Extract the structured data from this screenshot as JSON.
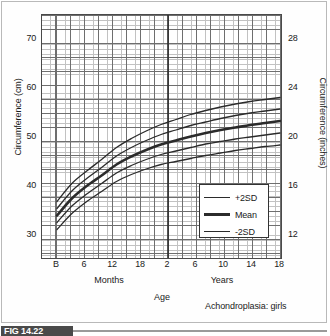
{
  "figure": {
    "tag": "FIG 14.22",
    "note": "Achondroplasia: girls"
  },
  "chart_data": {
    "type": "line",
    "title": "",
    "subtitle": "Achondroplasia: girls",
    "xlabel": "Age",
    "ylabel": "Circumference (cm)",
    "ylabel_right": "Circumference (inches)",
    "grid": true,
    "legend_position": "inside-bottom-right",
    "ylim": [
      26.5,
      75.5
    ],
    "yticks_left": [
      30,
      40,
      50,
      60,
      70
    ],
    "yticks_right": [
      12,
      16,
      20,
      24,
      28
    ],
    "x_group_labels": [
      "Months",
      "Years"
    ],
    "xticks": [
      {
        "label": "B",
        "group": "Months"
      },
      {
        "label": "6",
        "group": "Months"
      },
      {
        "label": "12",
        "group": "Months"
      },
      {
        "label": "18",
        "group": "Months"
      },
      {
        "label": "2",
        "group": "Years"
      },
      {
        "label": "6",
        "group": "Years"
      },
      {
        "label": "10",
        "group": "Years"
      },
      {
        "label": "14",
        "group": "Years"
      },
      {
        "label": "18",
        "group": "Years"
      }
    ],
    "x_axis_note": "Months scale from Birth to 2 years, then Years scale from 2 to 18",
    "series": [
      {
        "name": "+2SD",
        "style": "thin",
        "points_cm": [
          38.2,
          41.8,
          44.3,
          46.6,
          49.0,
          50.8,
          52.3,
          53.6,
          54.6,
          55.6,
          56.4,
          57.1,
          57.7,
          58.2,
          58.6,
          59.0
        ]
      },
      {
        "name": "+1SD",
        "style": "thin",
        "points_cm": [
          36.8,
          40.3,
          42.8,
          45.0,
          47.3,
          49.0,
          50.4,
          51.6,
          52.5,
          53.4,
          54.1,
          54.8,
          55.4,
          55.9,
          56.3,
          56.7
        ]
      },
      {
        "name": "Mean",
        "style": "thick",
        "points_cm": [
          35.4,
          38.8,
          41.3,
          43.4,
          45.6,
          47.2,
          48.5,
          49.6,
          50.4,
          51.2,
          51.9,
          52.5,
          53.0,
          53.5,
          53.9,
          54.3
        ]
      },
      {
        "name": "-1SD",
        "style": "thin",
        "points_cm": [
          34.0,
          37.3,
          39.7,
          41.8,
          43.9,
          45.4,
          46.6,
          47.6,
          48.3,
          49.0,
          49.7,
          50.2,
          50.7,
          51.1,
          51.5,
          51.9
        ]
      },
      {
        "name": "-2SD",
        "style": "thin",
        "points_cm": [
          32.6,
          35.8,
          38.2,
          40.2,
          42.2,
          43.6,
          44.7,
          45.6,
          46.2,
          46.8,
          47.4,
          47.9,
          48.4,
          48.8,
          49.2,
          49.5
        ]
      }
    ],
    "legend": [
      {
        "label": "+2SD",
        "style": "thin"
      },
      {
        "label": "Mean",
        "style": "thick"
      },
      {
        "label": "-2SD",
        "style": "thin"
      }
    ],
    "annotations": [
      {
        "type": "vertical-divider",
        "at": "2 years",
        "description": "heavy vertical line separating months scale from years scale"
      }
    ],
    "line_color": "#2b2b2b"
  }
}
